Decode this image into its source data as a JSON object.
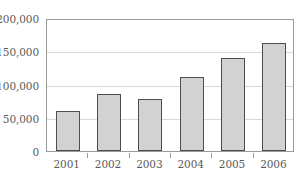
{
  "chart_data": {
    "type": "bar",
    "title": "",
    "subtitle": "",
    "xlabel": "",
    "ylabel": "",
    "categories": [
      "2001",
      "2002",
      "2003",
      "2004",
      "2005",
      "2006"
    ],
    "values": [
      60000,
      85000,
      78000,
      111000,
      140000,
      162000
    ],
    "series": [
      {
        "name": "",
        "values": [
          60000,
          85000,
          78000,
          111000,
          140000,
          162000
        ]
      }
    ],
    "ylim": [
      0,
      200000
    ],
    "yticks": [
      0,
      50000,
      100000,
      150000,
      200000
    ],
    "ytick_labels": [
      "0",
      "50,000",
      "100,000",
      "150,000",
      "200,000"
    ],
    "grid": true,
    "grid_axis": "y",
    "legend": false,
    "legend_position": "none",
    "bar_fill_color": "#d2d2d2",
    "bar_edge_color": "#4d4d4d",
    "gridline_color": "#d9d9d9",
    "frame_color": "#9a9a9a",
    "text_color": "#5a5a5a",
    "background_color": "#ffffff"
  }
}
